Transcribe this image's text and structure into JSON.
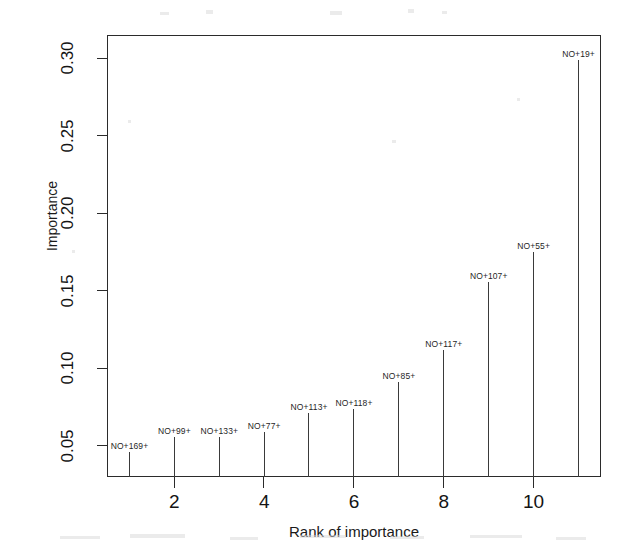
{
  "chart_data": {
    "type": "scatter",
    "title": "",
    "xlabel": "Rank of importance",
    "ylabel": "Importance",
    "xlim": [
      0.5,
      11.5
    ],
    "ylim": [
      0.03,
      0.315
    ],
    "grid": false,
    "legend": null,
    "x_ticks": [
      "2",
      "4",
      "6",
      "8",
      "10"
    ],
    "x_tick_values": [
      2,
      4,
      6,
      8,
      10
    ],
    "y_ticks": [
      "0.05",
      "0.10",
      "0.15",
      "0.20",
      "0.25",
      "0.30"
    ],
    "y_tick_values": [
      0.05,
      0.1,
      0.15,
      0.2,
      0.25,
      0.3
    ],
    "categories": [
      1,
      2,
      3,
      4,
      5,
      6,
      7,
      8,
      9,
      10,
      11
    ],
    "values": [
      0.046,
      0.056,
      0.056,
      0.059,
      0.071,
      0.074,
      0.091,
      0.112,
      0.156,
      0.175,
      0.299
    ],
    "point_labels": [
      "NO+169+",
      "NO+99+",
      "NO+133+",
      "NO+77+",
      "NO+113+",
      "NO+118+",
      "NO+85+",
      "NO+117+",
      "NO+107+",
      "NO+55+",
      "NO+19+"
    ],
    "points": [
      {
        "rank": 1,
        "importance": 0.046,
        "label": "NO+169+"
      },
      {
        "rank": 2,
        "importance": 0.056,
        "label": "NO+99+"
      },
      {
        "rank": 3,
        "importance": 0.056,
        "label": "NO+133+"
      },
      {
        "rank": 4,
        "importance": 0.059,
        "label": "NO+77+"
      },
      {
        "rank": 5,
        "importance": 0.071,
        "label": "NO+113+"
      },
      {
        "rank": 6,
        "importance": 0.074,
        "label": "NO+118+"
      },
      {
        "rank": 7,
        "importance": 0.091,
        "label": "NO+85+"
      },
      {
        "rank": 8,
        "importance": 0.112,
        "label": "NO+117+"
      },
      {
        "rank": 9,
        "importance": 0.156,
        "label": "NO+107+"
      },
      {
        "rank": 10,
        "importance": 0.175,
        "label": "NO+55+"
      },
      {
        "rank": 11,
        "importance": 0.299,
        "label": "NO+19+"
      }
    ],
    "colors": {
      "axis": "#2b2b2b",
      "stem": "#3a3a3a",
      "text": "#141414",
      "background": "#ffffff"
    }
  }
}
